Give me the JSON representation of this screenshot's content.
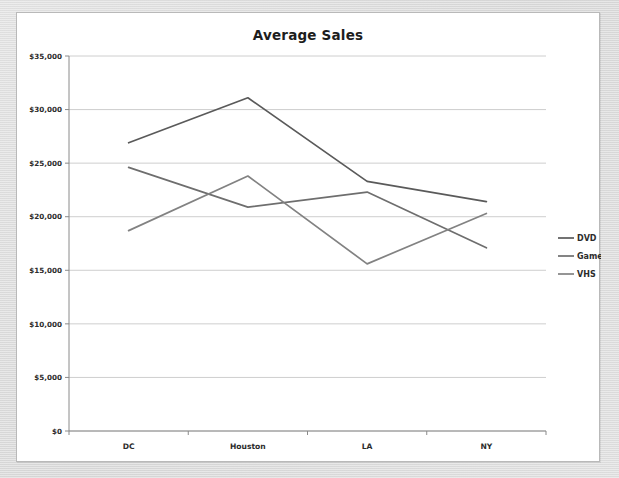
{
  "panel": {
    "background_color": "#ffffff",
    "border_color": "#b9b9b9"
  },
  "backdrop": {
    "color": "#dedede"
  },
  "chart_data": {
    "type": "line",
    "title": "Average Sales",
    "subtitle": "",
    "xlabel": "",
    "ylabel": "",
    "categories": [
      "DC",
      "Houston",
      "LA",
      "NY"
    ],
    "series": [
      {
        "name": "DVD",
        "color": "#5a5a5a",
        "values": [
          26900,
          31100,
          23300,
          21400
        ]
      },
      {
        "name": "Game",
        "color": "#6e6e6e",
        "values": [
          24600,
          20900,
          22300,
          17100
        ]
      },
      {
        "name": "VHS",
        "color": "#828282",
        "values": [
          18700,
          23800,
          15600,
          20300
        ]
      }
    ],
    "ylim": [
      0,
      35000
    ],
    "ytick_values": [
      0,
      5000,
      10000,
      15000,
      20000,
      25000,
      30000,
      35000
    ],
    "ytick_labels": [
      "$0",
      "$5,000",
      "$10,000",
      "$15,000",
      "$20,000",
      "$25,000",
      "$30,000",
      "$35,000"
    ],
    "grid": true,
    "grid_color": "#c8c8c8",
    "axis_color": "#8a8a8a",
    "legend_position": "right",
    "legend_entries": [
      "DVD",
      "Game",
      "VHS"
    ]
  }
}
